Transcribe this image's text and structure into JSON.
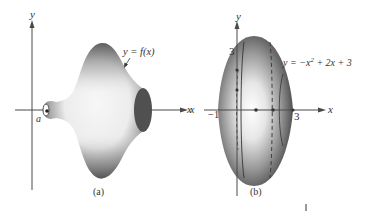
{
  "figure": {
    "panels": [
      {
        "id": "a",
        "caption": "(a)",
        "axis_labels": {
          "x": "x",
          "y": "y"
        },
        "point_label": "a",
        "curve_label": "y = f(x)",
        "description": "Solid of revolution generated by rotating y = f(x) about the x-axis, starting at x = a"
      },
      {
        "id": "b",
        "caption": "(b)",
        "axis_labels": {
          "x": "x",
          "y": "y"
        },
        "y_tick": "3",
        "x_ticks": [
          "−1",
          "3"
        ],
        "curve_label_prefix": "y = −x",
        "curve_label_exp": "2",
        "curve_label_suffix": " + 2x + 3",
        "description": "Solid of revolution generated by rotating y = −x² + 2x + 3 about the x-axis from x = −1 to x = 3"
      }
    ],
    "colors": {
      "background": "#ffffff",
      "axis": "#4a4a4a",
      "solid_dark": "#4d4d4d",
      "solid_mid": "#9a9a9a",
      "solid_light": "#f4f4f4",
      "end_cap": "#505050"
    }
  }
}
